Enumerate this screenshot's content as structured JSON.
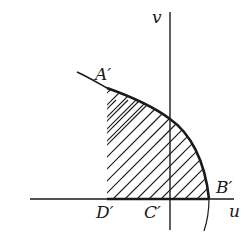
{
  "diagram": {
    "axes": {
      "horizontal_label": "u",
      "vertical_label": "v"
    },
    "points": {
      "A": "A′",
      "B": "B′",
      "C": "C′",
      "D": "D′"
    },
    "colors": {
      "stroke": "#1a1a1a",
      "background": "#ffffff"
    },
    "region": "shaded region bounded by curve A′B′, segment D′B′ on u-axis, and vertical line through D′"
  }
}
